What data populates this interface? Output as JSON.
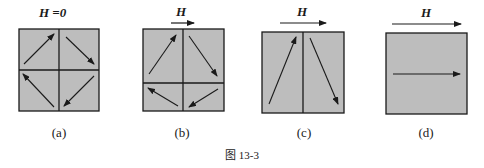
{
  "figure": {
    "caption": "图 13-3",
    "box_fill": "#bdbdbd",
    "stroke": "#1a1a1a",
    "panels": [
      {
        "id": "a",
        "label": "(a)",
        "field_label": "H =0",
        "field_arrow": false,
        "domains": "four quadrants, magnetization arrows circulating (closed flux loop)"
      },
      {
        "id": "b",
        "label": "(b)",
        "field_label": "H",
        "field_arrow": true,
        "domains": "upper domains grown, lower domains shrunk"
      },
      {
        "id": "c",
        "label": "(c)",
        "field_label": "H",
        "field_arrow": true,
        "domains": "two domains only, arrows tilted"
      },
      {
        "id": "d",
        "label": "(d)",
        "field_label": "H",
        "field_arrow": true,
        "domains": "single domain aligned with field"
      }
    ]
  }
}
